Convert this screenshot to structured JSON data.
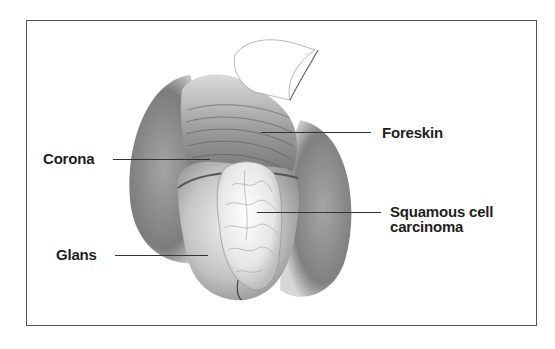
{
  "figure": {
    "labels": {
      "foreskin": "Foreskin",
      "corona": "Corona",
      "squamous_line1": "Squamous cell",
      "squamous_line2": "carcinoma",
      "glans": "Glans"
    }
  }
}
